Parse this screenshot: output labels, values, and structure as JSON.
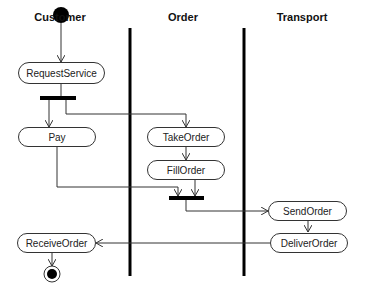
{
  "diagram": {
    "type": "UML activity diagram",
    "lanes": [
      {
        "id": "customer",
        "title": "Customer"
      },
      {
        "id": "order",
        "title": "Order"
      },
      {
        "id": "transport",
        "title": "Transport"
      }
    ],
    "activities": {
      "request_service": "RequestService",
      "pay": "Pay",
      "take_order": "TakeOrder",
      "fill_order": "FillOrder",
      "send_order": "SendOrder",
      "deliver_order": "DeliverOrder",
      "receive_order": "ReceiveOrder"
    },
    "flows": [
      [
        "start",
        "RequestService"
      ],
      [
        "RequestService",
        "fork1"
      ],
      [
        "fork1",
        "Pay"
      ],
      [
        "fork1",
        "TakeOrder"
      ],
      [
        "TakeOrder",
        "FillOrder"
      ],
      [
        "Pay",
        "join1"
      ],
      [
        "FillOrder",
        "join1"
      ],
      [
        "join1",
        "SendOrder"
      ],
      [
        "SendOrder",
        "DeliverOrder"
      ],
      [
        "DeliverOrder",
        "ReceiveOrder"
      ],
      [
        "ReceiveOrder",
        "end"
      ]
    ]
  }
}
